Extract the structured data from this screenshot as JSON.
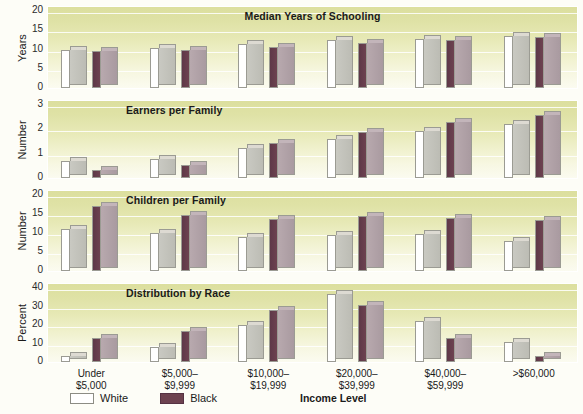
{
  "chart_data": {
    "type": "bar",
    "xlabel": "Income Level",
    "legend": [
      {
        "name": "White",
        "color": "#ffffff"
      },
      {
        "name": "Black",
        "color": "#6d4250"
      }
    ],
    "legend_position": "bottom-left",
    "grid": true,
    "categories": [
      "Under\n$5,000",
      "$5,000–\n$9,999",
      "$10,000–\n$19,999",
      "$20,000–\n$39,999",
      "$40,000–\n$59,999",
      ">$60,000"
    ],
    "category_lines": [
      [
        "Under",
        "$5,000"
      ],
      [
        "$5,000–",
        "$9,999"
      ],
      [
        "$10,000–",
        "$19,999"
      ],
      [
        "$20,000–",
        "$39,999"
      ],
      [
        "$40,000–",
        "$59,999"
      ],
      [
        ">$60,000",
        ""
      ]
    ],
    "panels": [
      {
        "title": "Median Years of Schooling",
        "ylabel": "Years",
        "ylim": [
          0,
          20
        ],
        "yticks": [
          0,
          5,
          10,
          15,
          20
        ],
        "series": [
          {
            "name": "White",
            "values": [
              10.0,
              10.3,
              11.5,
              12.4,
              12.8,
              13.6
            ]
          },
          {
            "name": "Black",
            "values": [
              9.6,
              9.8,
              10.6,
              11.8,
              12.4,
              13.2
            ]
          }
        ]
      },
      {
        "title": "Earners per Family",
        "ylabel": "Number",
        "ylim": [
          0,
          3
        ],
        "yticks": [
          0,
          1,
          2,
          3
        ],
        "series": [
          {
            "name": "White",
            "values": [
              0.7,
              0.8,
              1.25,
              1.6,
              1.95,
              2.2
            ]
          },
          {
            "name": "Black",
            "values": [
              0.32,
              0.55,
              1.45,
              1.9,
              2.3,
              2.6
            ]
          }
        ]
      },
      {
        "title": "Children per Family",
        "ylabel": "Number",
        "ylim": [
          0,
          20
        ],
        "yticks": [
          0,
          5,
          10,
          15,
          20
        ],
        "series": [
          {
            "name": "White",
            "values": [
              11.0,
              10.0,
              9.0,
              9.5,
              9.8,
              8.0
            ]
          },
          {
            "name": "Black",
            "values": [
              17.0,
              14.8,
              13.6,
              14.5,
              14.0,
              13.5
            ]
          }
        ]
      },
      {
        "title": "Distribution by Race",
        "ylabel": "Percent",
        "ylim": [
          0,
          40
        ],
        "yticks": [
          0,
          10,
          20,
          30,
          40
        ],
        "series": [
          {
            "name": "White",
            "values": [
              3,
              8,
              20,
              37,
              22,
              11
            ]
          },
          {
            "name": "Black",
            "values": [
              13,
              17,
              28,
              31,
              13,
              3
            ]
          }
        ]
      }
    ]
  },
  "colors": {
    "white_bar": "#ffffff",
    "black_bar": "#6d4250",
    "panel_top": "#dcdf9e",
    "panel_bottom": "#fbfbf0",
    "text": "#1a1a1a"
  }
}
